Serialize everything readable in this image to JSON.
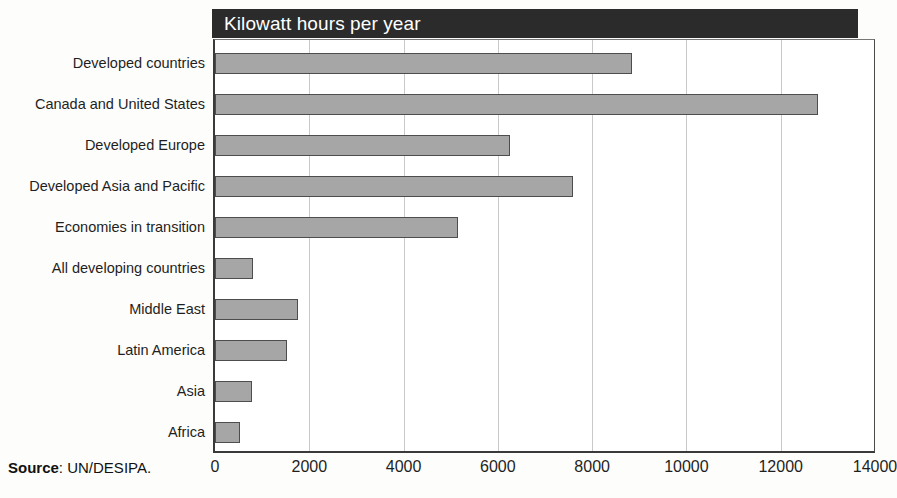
{
  "chart_data": {
    "type": "bar",
    "orientation": "horizontal",
    "title": "Kilowatt hours per year",
    "xlabel": "",
    "ylabel": "",
    "xlim": [
      0,
      14000
    ],
    "xticks": [
      0,
      2000,
      4000,
      6000,
      8000,
      10000,
      12000,
      14000
    ],
    "xtick_labels": [
      "0",
      "2000",
      "4000",
      "6000",
      "8000",
      "10000",
      "12000",
      "14000"
    ],
    "grid": "vertical",
    "legend": "none",
    "categories": [
      "Developed countries",
      "Canada and United States",
      "Developed Europe",
      "Developed Asia and Pacific",
      "Economies in transition",
      "All developing countries",
      "Middle East",
      "Latin America",
      "Asia",
      "Africa"
    ],
    "values": [
      8850,
      12800,
      6250,
      7600,
      5150,
      800,
      1750,
      1530,
      790,
      530
    ],
    "bar_color": "#a6a6a6",
    "bar_edge_color": "#4d4d4d",
    "title_banner_color": "#2b2b2b",
    "title_text_color": "#ffffff",
    "grid_color": "#c9c9c9",
    "axis_color": "#3a3a3a"
  },
  "source": {
    "label": "Source",
    "separator": ": ",
    "value": "UN/DESIPA."
  }
}
